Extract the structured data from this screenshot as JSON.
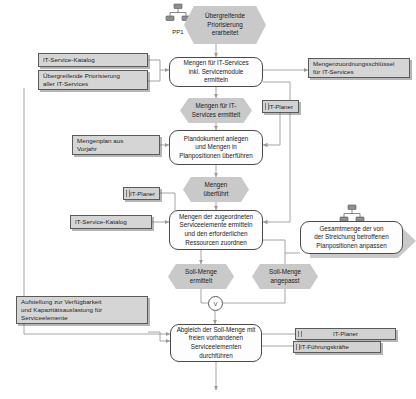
{
  "diagram": {
    "type": "epc-process-chain",
    "language": "de",
    "colors": {
      "event_fill": "#c9c9c9",
      "function_fill": "#fdfdfd",
      "document_fill": "#d5d5d5",
      "role_fill": "#d2d2d2",
      "line": "#9a9a9a",
      "border": "#5a5a5a"
    }
  },
  "process_paths": [
    {
      "id": "pp1",
      "label": "PP1",
      "icon": "org-chart-icon"
    },
    {
      "id": "pp6",
      "label": "PP6",
      "icon": "org-chart-icon"
    }
  ],
  "events": [
    {
      "id": "ev_prio",
      "lines": [
        "Übergreifende",
        "Priorisierung",
        "erarbeitet"
      ]
    },
    {
      "id": "ev_mengen_it",
      "lines": [
        "Mengen für IT-",
        "Services ermittelt"
      ]
    },
    {
      "id": "ev_ueberfuehrt",
      "lines": [
        "Mengen",
        "überführt"
      ]
    },
    {
      "id": "ev_soll_erm",
      "lines": [
        "Soll-Menge",
        "ermittelt"
      ]
    },
    {
      "id": "ev_soll_ang",
      "lines": [
        "Soll-Menge",
        "angepasst"
      ]
    }
  ],
  "functions": [
    {
      "id": "fn_mengen_services",
      "lines": [
        "Mengen für IT-Services",
        "inkl. Servicemodule",
        "ermitteln"
      ]
    },
    {
      "id": "fn_plandokument",
      "lines": [
        "Plandokument anlegen",
        "und Mengen in",
        "Planpositionen überführen"
      ]
    },
    {
      "id": "fn_serviceelemente",
      "lines": [
        "Mengen der zugeordneten",
        "Serviceelemente ermitteln",
        "und den erforderlichen",
        "Ressourcen zuordnen"
      ]
    },
    {
      "id": "fn_gesamtmenge",
      "lines": [
        "Gesamtmenge der von",
        "der Streichung betroffenen",
        "Planpositionen anpassen"
      ]
    },
    {
      "id": "fn_abgleich",
      "lines": [
        "Abgleich der Soll-Menge mit",
        "freien vorhandenen",
        "Serviceelementen durchführen"
      ]
    }
  ],
  "documents": [
    {
      "id": "doc_katalog1",
      "lines": [
        "IT-Service-Katalog"
      ]
    },
    {
      "id": "doc_prio_alle",
      "lines": [
        "Übergreifende Priorisierung",
        "aller IT-Services"
      ]
    },
    {
      "id": "doc_schluessel",
      "lines": [
        "Mengenzuordnungsschlüssel",
        "für IT-Services"
      ]
    },
    {
      "id": "doc_mengenplan",
      "lines": [
        "Mengenplan aus",
        "Vorjahr"
      ]
    },
    {
      "id": "doc_katalog2",
      "lines": [
        "IT-Service-Katalog"
      ]
    },
    {
      "id": "doc_aufstellung",
      "lines": [
        "Aufstellung zur Verfügbarkeit",
        "und Kapazitätsauslastung für",
        "Serviceelemente"
      ]
    }
  ],
  "roles": [
    {
      "id": "role_planer1",
      "label": "IT-Planer"
    },
    {
      "id": "role_planer2",
      "label": "IT-Planer"
    },
    {
      "id": "role_planer3",
      "label": "IT-Planer"
    },
    {
      "id": "role_fuehrung",
      "label": "IT-Führungskräfte"
    }
  ],
  "connectors": [
    {
      "id": "conn_xor",
      "symbol": "V",
      "kind": "or-connector"
    }
  ]
}
